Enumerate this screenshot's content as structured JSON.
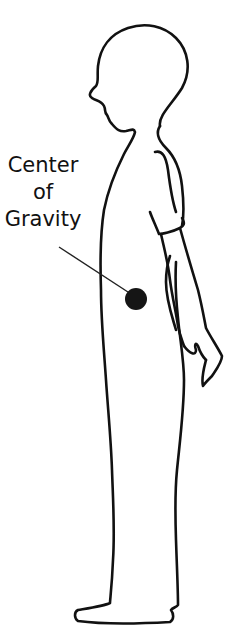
{
  "diagram": {
    "label": {
      "line1": "Center",
      "line2": "of",
      "line3": "Gravity"
    },
    "marker": {
      "name": "center-of-gravity-dot",
      "color": "#151515"
    },
    "stroke_color": "#111111",
    "background": "#ffffff"
  }
}
